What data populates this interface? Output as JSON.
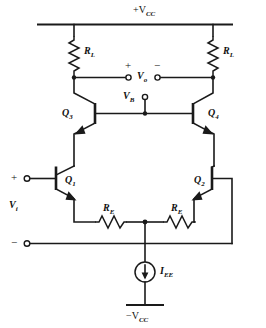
{
  "figure": {
    "type": "schematic",
    "background_color": "#ffffff",
    "line_color": "#1a1a1a"
  },
  "rails": {
    "positive_supply_label": "+V",
    "positive_supply_sub": "CC",
    "negative_supply_label": "−V",
    "negative_supply_sub": "CC"
  },
  "components": {
    "load_resistor_left": {
      "label": "R",
      "sub": "L"
    },
    "load_resistor_right": {
      "label": "R",
      "sub": "L"
    },
    "emitter_resistor_left": {
      "label": "R",
      "sub": "E"
    },
    "emitter_resistor_right": {
      "label": "R",
      "sub": "E"
    },
    "transistor_q1": {
      "label": "Q",
      "sub": "1"
    },
    "transistor_q2": {
      "label": "Q",
      "sub": "2"
    },
    "transistor_q3": {
      "label": "Q",
      "sub": "3"
    },
    "transistor_q4": {
      "label": "Q",
      "sub": "4"
    },
    "current_source": {
      "label": "I",
      "sub": "EE"
    }
  },
  "nodes": {
    "output_voltage": {
      "label": "V",
      "sub": "o"
    },
    "output_plus_sign": "+",
    "output_minus_sign": "−",
    "bias_voltage": {
      "label": "V",
      "sub": "B"
    },
    "input_voltage": {
      "label": "V",
      "sub": "i"
    },
    "input_plus_sign": "+",
    "input_minus_sign": "−"
  }
}
